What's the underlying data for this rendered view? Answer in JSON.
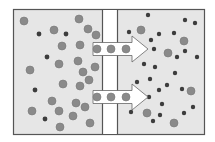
{
  "diagram": {
    "title": "",
    "frame": {
      "x": 13,
      "y": 9,
      "width": 191,
      "height": 125,
      "fill": "#e6e6e6",
      "stroke": "#555555"
    },
    "membrane": {
      "x": 102,
      "width": 15,
      "fill": "#ffffff",
      "stroke": "#555555"
    },
    "colors": {
      "large_particle": "#8a8a8a",
      "large_particle_edge": "#777777",
      "small_particle": "#3d3d3d",
      "arrow_fill": "#ffffff",
      "arrow_stroke": "#666666"
    },
    "left_chamber": {
      "large_particles": [
        [
          24,
          21
        ],
        [
          54,
          30
        ],
        [
          79,
          19
        ],
        [
          88,
          29
        ],
        [
          96,
          35
        ],
        [
          62,
          46
        ],
        [
          80,
          45
        ],
        [
          59,
          64
        ],
        [
          78,
          61
        ],
        [
          95,
          67
        ],
        [
          30,
          70
        ],
        [
          83,
          72
        ],
        [
          63,
          84
        ],
        [
          80,
          86
        ],
        [
          89,
          80
        ],
        [
          52,
          101
        ],
        [
          76,
          103
        ],
        [
          85,
          107
        ],
        [
          32,
          111
        ],
        [
          59,
          111
        ],
        [
          73,
          116
        ],
        [
          90,
          123
        ],
        [
          60,
          127
        ]
      ],
      "small_particles": [
        [
          39,
          34
        ],
        [
          66,
          34
        ],
        [
          47,
          57
        ],
        [
          35,
          90
        ],
        [
          45,
          119
        ]
      ]
    },
    "right_chamber": {
      "large_particles": [
        [
          141,
          30
        ],
        [
          184,
          41
        ],
        [
          168,
          53
        ],
        [
          191,
          91
        ],
        [
          147,
          113
        ],
        [
          174,
          123
        ]
      ],
      "small_particles": [
        [
          148,
          15
        ],
        [
          185,
          20
        ],
        [
          195,
          23
        ],
        [
          129,
          32
        ],
        [
          159,
          34
        ],
        [
          174,
          33
        ],
        [
          151,
          40
        ],
        [
          154,
          49
        ],
        [
          185,
          51
        ],
        [
          177,
          57
        ],
        [
          197,
          57
        ],
        [
          144,
          64
        ],
        [
          155,
          67
        ],
        [
          175,
          73
        ],
        [
          150,
          79
        ],
        [
          137,
          82
        ],
        [
          167,
          85
        ],
        [
          159,
          90
        ],
        [
          182,
          89
        ],
        [
          149,
          97
        ],
        [
          162,
          104
        ],
        [
          193,
          107
        ],
        [
          131,
          112
        ],
        [
          160,
          115
        ],
        [
          184,
          113
        ],
        [
          153,
          121
        ]
      ]
    },
    "arrows": [
      {
        "y": 49,
        "x_start": 93,
        "x_end": 148,
        "particles_x": [
          97,
          111,
          126
        ]
      },
      {
        "y": 97,
        "x_start": 93,
        "x_end": 148,
        "particles_x": [
          97,
          111,
          126
        ]
      }
    ]
  }
}
